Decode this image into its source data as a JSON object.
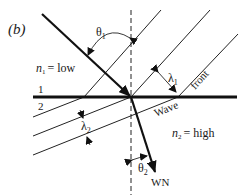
{
  "figure": {
    "panel_label": "(b)",
    "medium1": {
      "symbol": "n",
      "subscript": "1",
      "value": "= low"
    },
    "medium2": {
      "symbol": "n",
      "subscript": "2",
      "value": "= high"
    },
    "region_labels": {
      "upper": "1",
      "lower": "2"
    },
    "angles": {
      "theta1": {
        "symbol": "θ",
        "subscript": "1"
      },
      "theta2": {
        "symbol": "θ",
        "subscript": "2"
      }
    },
    "wavelengths": {
      "lambda1": {
        "symbol": "λ",
        "subscript": "1"
      },
      "lambda2": {
        "symbol": "λ",
        "subscript": "2"
      }
    },
    "wave_front_label": {
      "word1": "Wave",
      "word2": "front"
    },
    "wave_normal_label": "WN",
    "colors": {
      "line": "#111111",
      "background": "#ffffff"
    }
  }
}
